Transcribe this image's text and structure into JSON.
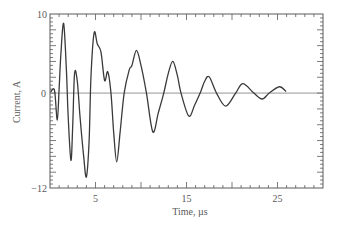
{
  "chart_data": {
    "type": "line",
    "title": "",
    "xlabel": "Time, µs",
    "ylabel": "Current, A",
    "xlim": [
      0,
      30
    ],
    "ylim": [
      -12,
      10
    ],
    "grid": false,
    "legend": null,
    "xtick_values": [
      5,
      15,
      25
    ],
    "xtick_labels": [
      "5",
      "15",
      "25"
    ],
    "ytick_values": [
      10,
      0,
      -12
    ],
    "ytick_labels": [
      "10",
      "0",
      "−12"
    ],
    "minor_x_step": 1,
    "major_x_step": 5,
    "minor_y_step": 0.5,
    "major_y_step": 2,
    "reference_line": {
      "y": 0
    },
    "series": [
      {
        "name": "Current",
        "x": [
          0.1,
          0.5,
          0.8,
          1.0,
          1.2,
          1.5,
          1.8,
          2.0,
          2.3,
          2.5,
          2.7,
          3.0,
          3.3,
          3.7,
          4.0,
          4.3,
          4.5,
          4.85,
          5.2,
          5.6,
          6.0,
          6.35,
          6.7,
          7.0,
          7.33,
          7.7,
          8.15,
          8.7,
          9.0,
          9.5,
          10.0,
          10.6,
          11.3,
          11.9,
          12.5,
          13.0,
          13.5,
          14.0,
          14.4,
          15.25,
          15.9,
          16.5,
          17.0,
          17.5,
          18.3,
          19.3,
          20.4,
          21.2,
          22.4,
          23.3,
          24.1,
          25.2,
          25.9
        ],
        "y": [
          0.2,
          0.3,
          -3.4,
          0.5,
          5.0,
          8.8,
          3.0,
          -3.0,
          -8.5,
          -4.0,
          2.5,
          1.5,
          -3.0,
          -8.0,
          -10.6,
          -6.0,
          2.0,
          7.6,
          6.2,
          5.2,
          1.6,
          2.7,
          0.0,
          -5.0,
          -8.7,
          -5.0,
          0.0,
          2.9,
          3.5,
          5.4,
          3.5,
          0.0,
          -4.9,
          -2.5,
          0.0,
          2.5,
          4.0,
          2.2,
          0.0,
          -2.9,
          -1.5,
          0.0,
          1.5,
          2.05,
          0.0,
          -1.65,
          0.0,
          1.2,
          0.0,
          -0.75,
          0.0,
          0.8,
          0.25
        ]
      }
    ]
  },
  "colors": {
    "trace": "#3a3a3a",
    "axes": "#5a5a5a",
    "background": "#ffffff"
  }
}
